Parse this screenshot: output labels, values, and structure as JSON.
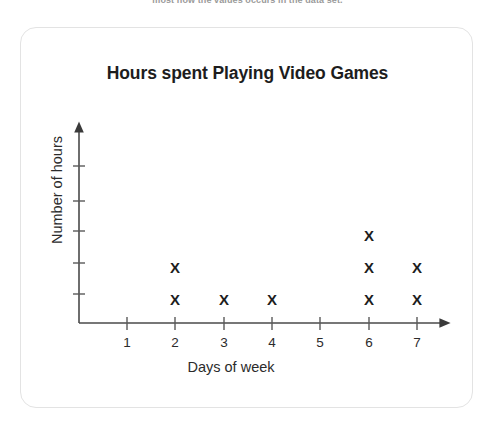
{
  "clipped_header": {
    "text": "most how the values occurs in the data set."
  },
  "card": {
    "title": "Hours spent Playing Video Games"
  },
  "chart_data": {
    "type": "scatter",
    "plot_style": "dot-plot",
    "title": "Hours spent Playing Video Games",
    "xlabel": "Days of week",
    "ylabel": "Number of hours",
    "categories": [
      "1",
      "2",
      "3",
      "4",
      "5",
      "6",
      "7"
    ],
    "values": [
      0,
      2,
      1,
      1,
      0,
      3,
      2
    ],
    "mark_glyph": "X",
    "x_tick_labels": [
      "1",
      "2",
      "3",
      "4",
      "5",
      "6",
      "7"
    ],
    "y_tick_labels": [
      "",
      "",
      "",
      "",
      ""
    ],
    "y_tick_count": 5,
    "grid": false,
    "legend": false,
    "axis_arrows": true,
    "colors": {
      "axis": "#555555",
      "mark": "#1d1d1d",
      "title": "#1d1d1d",
      "card_border": "#e3e3e3",
      "background": "#ffffff"
    },
    "geometry": {
      "origin_x": 78,
      "origin_y": 317,
      "x_step": 48.3,
      "y_step": 32,
      "x_axis_end": 448,
      "y_axis_top": 122
    }
  }
}
